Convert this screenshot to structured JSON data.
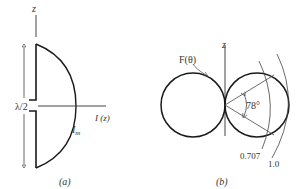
{
  "panel_a": {
    "z_label": "z",
    "half_wavelength_label": "λ/2",
    "current_axis_label": "I (z)",
    "peak_current_label": "I",
    "peak_current_sub": "m",
    "caption": "(a)"
  },
  "panel_b": {
    "pattern_label": "F(θ)",
    "z_label": "z",
    "angle_label": "78°",
    "half_power_level_label": "0.707",
    "max_level_label": "1.0",
    "caption": "(b)"
  },
  "colors": {
    "stroke_dark": "#1a1a1a",
    "stroke_light": "#444444",
    "text": "#333333",
    "background": "#ffffff"
  }
}
